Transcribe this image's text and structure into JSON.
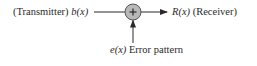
{
  "diagram": {
    "type": "block-diagram",
    "title": "",
    "nodes": [
      {
        "id": "transmitter",
        "role": "Transmitter",
        "signal": "b(x)"
      },
      {
        "id": "adder",
        "symbol": "+",
        "shape": "circle"
      },
      {
        "id": "receiver",
        "role": "Receiver",
        "signal": "R(x)"
      },
      {
        "id": "error",
        "role": "Error pattern",
        "signal": "e(x)"
      }
    ],
    "edges": [
      {
        "from": "transmitter",
        "to": "adder"
      },
      {
        "from": "error",
        "to": "adder"
      },
      {
        "from": "adder",
        "to": "receiver"
      }
    ],
    "labels": {
      "transmitter_prefix": "(Transmitter) ",
      "transmitter_signal": "b(x)",
      "receiver_signal": "R(x)",
      "receiver_suffix": " (Receiver)",
      "error_signal": "e(x)",
      "error_suffix": " Error pattern",
      "adder_symbol": "+"
    },
    "colors": {
      "line": "#2a2a2a",
      "adder_fill": "#b8b8b8",
      "adder_stroke": "#555555",
      "text": "#2a2a2a"
    }
  }
}
